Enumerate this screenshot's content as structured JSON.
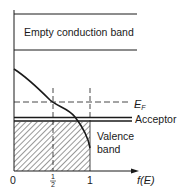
{
  "diagram": {
    "type": "band-diagram",
    "title": "",
    "colors": {
      "ink": "#1a1a1a",
      "background": "#ffffff"
    },
    "labels": {
      "conduction_band": "Empty conduction band",
      "fermi_level": "E",
      "fermi_subscript": "F",
      "acceptor": "Acceptor",
      "valence_line1": "Valence",
      "valence_line2": "band",
      "x_axis": "f(E)"
    },
    "x_ticks": [
      {
        "label": "0",
        "value": 0
      },
      {
        "label": "1",
        "value": 0.5,
        "fraction": true,
        "numerator": "1",
        "denominator": "2"
      },
      {
        "label": "1",
        "value": 1
      }
    ]
  }
}
